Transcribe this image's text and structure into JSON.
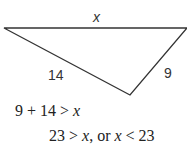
{
  "diagram": {
    "type": "triangle",
    "vertices": {
      "left": [
        4,
        28
      ],
      "right": [
        187,
        28
      ],
      "bottom": [
        130,
        95
      ]
    },
    "sides": [
      {
        "id": "top",
        "label": "x"
      },
      {
        "id": "left",
        "label": "14"
      },
      {
        "id": "right",
        "label": "9"
      }
    ],
    "stroke_color": "#333333"
  },
  "work": {
    "line1": {
      "a": "9 + 14 > ",
      "var": "x"
    },
    "line2": {
      "a": "23 > ",
      "var1": "x",
      "b": ", or ",
      "var2": "x",
      "c": " < 23"
    }
  }
}
